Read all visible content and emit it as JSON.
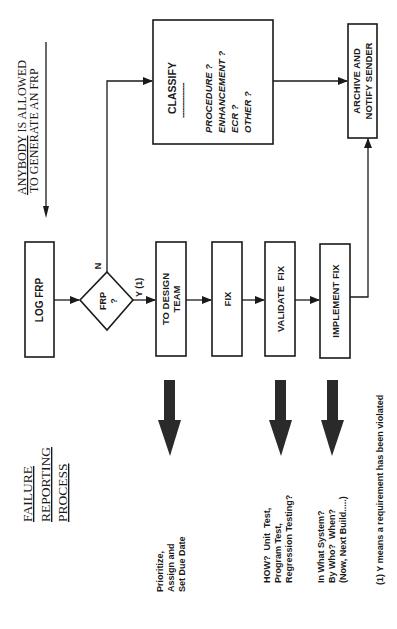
{
  "title": {
    "lines": [
      "FAILURE",
      "REPORTING",
      "PROCESS"
    ]
  },
  "note_top": {
    "line1_underlined": "ANYBODY",
    "line1_rest": " IS ALLOWED",
    "line2": "TO GENERATE AN FRP"
  },
  "nodes": {
    "log_frp": "LOG FRP",
    "decision": {
      "line1": "FRP",
      "line2": "?"
    },
    "decision_no": "N",
    "decision_yes": "Y (1)",
    "to_design_team": {
      "line1": "TO DESIGN",
      "line2": "TEAM"
    },
    "fix": "FIX",
    "validate_fix": "VALIDATE  FIX",
    "implement_fix": "IMPLEMENT FIX",
    "archive": {
      "line1": "ARCHIVE AND",
      "line2": "NOTIFY SENDER"
    },
    "classify": {
      "heading": "CLASSIFY",
      "divider": "--------------",
      "options": [
        "PROCEDURE ?",
        "ENHANCEMENT ?",
        "ECR ?",
        "OTHER ?"
      ]
    }
  },
  "annotations": {
    "prioritize": [
      "Prioritize,",
      "Assign and",
      "Set Due Date"
    ],
    "validate_how": [
      "HOW?  Unit  Test,",
      "Program Test,",
      "Regression Testing?"
    ],
    "implement_where": [
      "In What System?",
      "By Who?  When?",
      "(Now, Next Build.....)"
    ]
  },
  "footnote": "(1) Y means a requirement has been violated",
  "colors": {
    "ink": "#1a1a1a",
    "block_arrow": "#2a2a2a",
    "background": "#ffffff"
  }
}
